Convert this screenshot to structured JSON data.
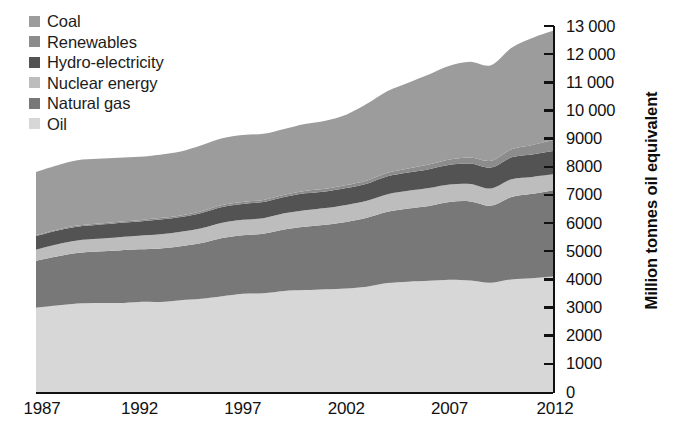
{
  "chart_data": {
    "type": "area",
    "stacked": true,
    "title": "",
    "subtitle": "",
    "xlabel": "",
    "ylabel": "Million tonnes oil equivalent",
    "xlim": [
      1987,
      2012
    ],
    "ylim": [
      0,
      13000
    ],
    "ytick_step": 1000,
    "grid": false,
    "legend_position": "top-left",
    "x": [
      1987,
      1988,
      1989,
      1990,
      1991,
      1992,
      1993,
      1994,
      1995,
      1996,
      1997,
      1998,
      1999,
      2000,
      2001,
      2002,
      2003,
      2004,
      2005,
      2006,
      2007,
      2008,
      2009,
      2010,
      2011,
      2012
    ],
    "xticks": [
      "1987",
      "1992",
      "1997",
      "2002",
      "2007",
      "2012"
    ],
    "xtick_values": [
      1987,
      1992,
      1997,
      2002,
      2007,
      2012
    ],
    "yticks": [
      "0",
      "1000",
      "2000",
      "3000",
      "4000",
      "5000",
      "6000",
      "7000",
      "8000",
      "9000",
      "10 000",
      "11 000",
      "12 000",
      "13 000"
    ],
    "ytick_values": [
      0,
      1000,
      2000,
      3000,
      4000,
      5000,
      6000,
      7000,
      8000,
      9000,
      10000,
      11000,
      12000,
      13000
    ],
    "stack_order_bottom_to_top": [
      "Oil",
      "Natural gas",
      "Nuclear energy",
      "Hydro-electricity",
      "Renewables",
      "Coal"
    ],
    "series": [
      {
        "name": "Oil",
        "color": "#d7d7d7",
        "values": [
          2990,
          3070,
          3140,
          3160,
          3160,
          3200,
          3200,
          3260,
          3310,
          3400,
          3490,
          3510,
          3590,
          3620,
          3650,
          3680,
          3740,
          3870,
          3920,
          3950,
          3990,
          3960,
          3880,
          4000,
          4040,
          4100
        ]
      },
      {
        "name": "Natural gas",
        "color": "#787878",
        "values": [
          1670,
          1740,
          1800,
          1830,
          1870,
          1870,
          1900,
          1920,
          1980,
          2070,
          2080,
          2110,
          2180,
          2250,
          2290,
          2360,
          2450,
          2530,
          2600,
          2660,
          2760,
          2810,
          2740,
          2930,
          3000,
          3070
        ]
      },
      {
        "name": "Nuclear energy",
        "color": "#bdbdbd",
        "values": [
          400,
          430,
          440,
          450,
          470,
          480,
          500,
          510,
          525,
          545,
          545,
          555,
          575,
          585,
          595,
          605,
          600,
          625,
          625,
          635,
          620,
          620,
          610,
          625,
          600,
          560
        ]
      },
      {
        "name": "Hydro-electricity",
        "color": "#535353",
        "values": [
          480,
          490,
          490,
          500,
          505,
          505,
          525,
          525,
          545,
          560,
          565,
          575,
          580,
          600,
          590,
          600,
          610,
          635,
          650,
          670,
          700,
          725,
          740,
          780,
          795,
          830
        ]
      },
      {
        "name": "Renewables",
        "color": "#8c8c8c",
        "values": [
          35,
          37,
          40,
          42,
          45,
          48,
          52,
          55,
          60,
          64,
          68,
          73,
          80,
          87,
          94,
          104,
          114,
          127,
          142,
          163,
          186,
          215,
          245,
          290,
          340,
          390
        ]
      },
      {
        "name": "Coal",
        "color": "#9c9c9c",
        "values": [
          2240,
          2280,
          2320,
          2300,
          2270,
          2250,
          2250,
          2270,
          2340,
          2370,
          2380,
          2350,
          2340,
          2380,
          2420,
          2500,
          2720,
          2900,
          3050,
          3200,
          3330,
          3400,
          3390,
          3600,
          3800,
          3880
        ]
      }
    ]
  },
  "legend": {
    "items": [
      {
        "label": "Coal",
        "color": "#9c9c9c"
      },
      {
        "label": "Renewables",
        "color": "#8c8c8c"
      },
      {
        "label": "Hydro-electricity",
        "color": "#535353"
      },
      {
        "label": "Nuclear energy",
        "color": "#bdbdbd"
      },
      {
        "label": "Natural gas",
        "color": "#787878"
      },
      {
        "label": "Oil",
        "color": "#d7d7d7"
      }
    ]
  },
  "axes": {
    "y_title": "Million tonnes oil equivalent",
    "y_labels": [
      "13 000",
      "12 000",
      "11 000",
      "10 000",
      "9000",
      "8000",
      "7000",
      "6000",
      "5000",
      "4000",
      "3000",
      "2000",
      "1000",
      "0"
    ],
    "x_labels": [
      "1987",
      "1992",
      "1997",
      "2002",
      "2007",
      "2012"
    ]
  },
  "style": {
    "axis_color": "#111111",
    "background": "#ffffff",
    "text_color": "#1a1a1a"
  }
}
